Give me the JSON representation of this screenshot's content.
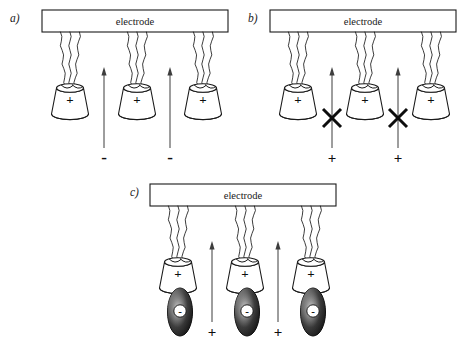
{
  "figure": {
    "background_color": "#ffffff",
    "ink_color": "#1a1a1a",
    "width": 475,
    "height": 358
  },
  "panels": [
    {
      "id": "a",
      "label": "a)",
      "label_x": 10,
      "label_y": 22,
      "electrode": {
        "text": "electrode",
        "x": 42,
        "y": 10,
        "width": 186,
        "height": 22
      },
      "hosts": [
        {
          "cx": 70,
          "charge": "+"
        },
        {
          "cx": 137,
          "charge": "+"
        },
        {
          "cx": 203,
          "charge": "+"
        }
      ],
      "host_top_y": 88,
      "chain_top_y": 32,
      "arrows": [
        {
          "x": 104,
          "y_tail": 148,
          "y_head": 67
        },
        {
          "x": 170,
          "y_tail": 148,
          "y_head": 67
        }
      ],
      "free_ions": [
        {
          "x": 104,
          "y": 163,
          "sign": "-",
          "kind": "minus"
        },
        {
          "x": 170,
          "y": 163,
          "sign": "-",
          "kind": "minus"
        }
      ],
      "blockers": [],
      "guests": []
    },
    {
      "id": "b",
      "label": "b)",
      "label_x": 248,
      "label_y": 22,
      "electrode": {
        "text": "electrode",
        "x": 270,
        "y": 10,
        "width": 186,
        "height": 22
      },
      "hosts": [
        {
          "cx": 298,
          "charge": "+"
        },
        {
          "cx": 365,
          "charge": "+"
        },
        {
          "cx": 431,
          "charge": "+"
        }
      ],
      "host_top_y": 88,
      "chain_top_y": 32,
      "arrows": [
        {
          "x": 332,
          "y_tail": 148,
          "y_head": 67
        },
        {
          "x": 398,
          "y_tail": 148,
          "y_head": 67
        }
      ],
      "free_ions": [
        {
          "x": 332,
          "y": 163,
          "sign": "+",
          "kind": "plus"
        },
        {
          "x": 398,
          "y": 163,
          "sign": "+",
          "kind": "plus"
        }
      ],
      "blockers": [
        {
          "x": 332,
          "y": 118,
          "size": 9
        },
        {
          "x": 398,
          "y": 118,
          "size": 9
        }
      ],
      "guests": []
    },
    {
      "id": "c",
      "label": "c)",
      "label_x": 130,
      "label_y": 196,
      "electrode": {
        "text": "electrode",
        "x": 150,
        "y": 184,
        "width": 186,
        "height": 22
      },
      "hosts": [
        {
          "cx": 178,
          "charge": "+"
        },
        {
          "cx": 245,
          "charge": "+"
        },
        {
          "cx": 311,
          "charge": "+"
        }
      ],
      "host_top_y": 262,
      "chain_top_y": 206,
      "arrows": [
        {
          "x": 212,
          "y_tail": 322,
          "y_head": 241
        },
        {
          "x": 278,
          "y_tail": 322,
          "y_head": 241
        }
      ],
      "free_ions": [
        {
          "x": 212,
          "y": 337,
          "sign": "+",
          "kind": "plus"
        },
        {
          "x": 278,
          "y": 337,
          "sign": "+",
          "kind": "plus"
        }
      ],
      "blockers": [],
      "guests": [
        {
          "cx": 180,
          "cy": 312,
          "rx": 12.5,
          "ry": 24,
          "charge": "-"
        },
        {
          "cx": 247,
          "cy": 312,
          "rx": 12.5,
          "ry": 24,
          "charge": "-"
        },
        {
          "cx": 313,
          "cy": 312,
          "rx": 12.5,
          "ry": 24,
          "charge": "-"
        }
      ]
    }
  ],
  "legend_semantics": {
    "electrode_label": "electrode",
    "host_charge": "+",
    "guest_charge": "-",
    "anion_label": "-",
    "cation_label": "+",
    "blocked_symbol": "X",
    "chains_per_host": 3,
    "hosts_per_panel": 3
  },
  "colors": {
    "ink": "#1a1a1a",
    "arrow": "#3d3d3d",
    "guest_dark": "#0a0a0a",
    "guest_highlight": "#d8d8d8",
    "paper": "#ffffff"
  }
}
